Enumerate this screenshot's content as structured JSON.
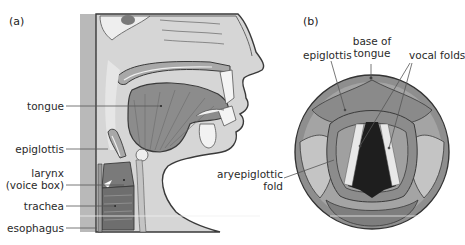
{
  "panels": {
    "a": {
      "label": "(a)"
    },
    "b": {
      "label": "(b)"
    }
  },
  "panel_a_labels": {
    "tongue": "tongue",
    "epiglottis": "epiglottis",
    "larynx_line1": "larynx",
    "larynx_line2": "(voice box)",
    "trachea": "trachea",
    "esophagus": "esophagus"
  },
  "panel_b_labels": {
    "epiglottis": "epiglottis",
    "base_of_tongue_line1": "base of",
    "base_of_tongue_line2": "tongue",
    "vocal_folds": "vocal folds",
    "aryepiglottic_line1": "aryepiglottic",
    "aryepiglottic_line2": "fold"
  },
  "colors": {
    "background": "#ffffff",
    "light_tissue": "#dcdcdc",
    "mid_tissue": "#a8a8a8",
    "dark_tissue": "#7a7a7a",
    "darkest": "#262626",
    "outline": "#3a3a3a",
    "leader_line": "#555555",
    "highlight": "#f2f2f2"
  }
}
